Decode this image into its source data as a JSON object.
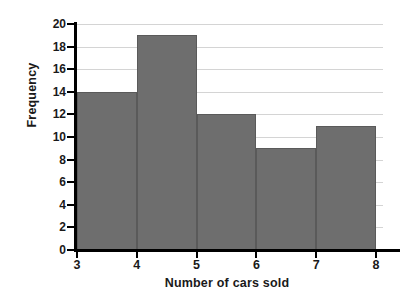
{
  "chart_data": {
    "type": "bar",
    "title": "",
    "xlabel": "Number of cars sold",
    "ylabel": "Frequency",
    "categories": [
      "3-4",
      "4-5",
      "5-6",
      "6-7",
      "7-8"
    ],
    "bin_edges": [
      3,
      4,
      5,
      6,
      7,
      8
    ],
    "values": [
      14,
      19,
      12,
      9,
      11
    ],
    "xlim": [
      3,
      8
    ],
    "ylim": [
      0,
      20
    ],
    "x_ticks": [
      "3",
      "4",
      "5",
      "6",
      "7",
      "8"
    ],
    "y_ticks": [
      "0",
      "2",
      "4",
      "6",
      "8",
      "10",
      "12",
      "14",
      "16",
      "18",
      "20"
    ],
    "y_tick_step": 2,
    "grid": "horizontal",
    "legend": "none",
    "bar_color": "#6e6e6e",
    "bar_edge_color": "#5a5a5a",
    "grid_color": "#d4d4d4",
    "axis_color": "#000000",
    "background_color": "#ffffff"
  }
}
